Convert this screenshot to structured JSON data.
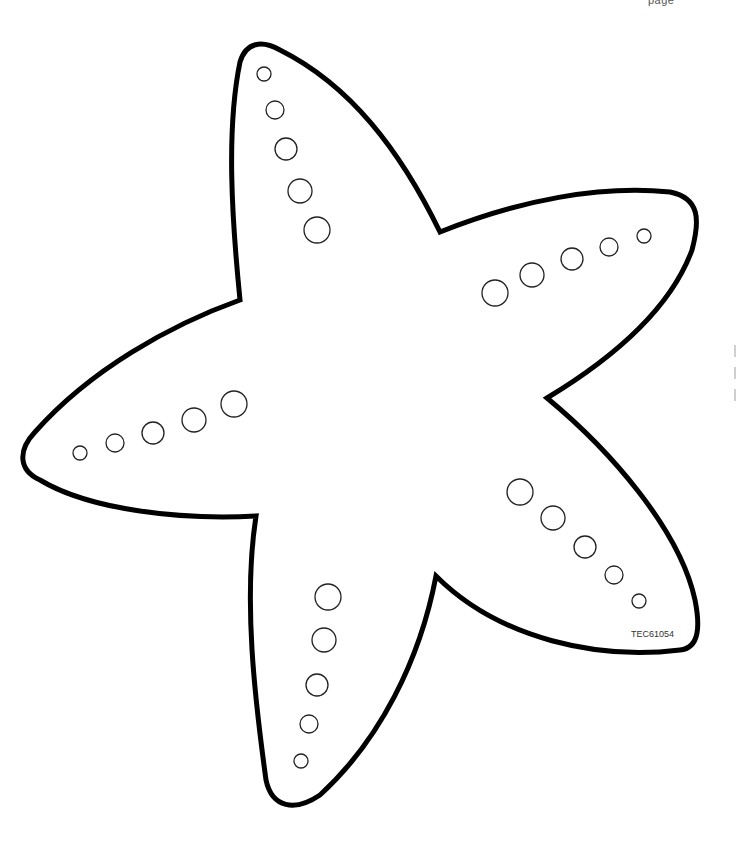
{
  "page": {
    "header_fragment": "page",
    "item_code": "TEC61054"
  },
  "illustration": {
    "subject": "starfish-outline",
    "outline_color": "#000000",
    "fill_color": "#ffffff",
    "spot_color": "#222222",
    "arms": [
      {
        "name": "top",
        "spots": 5
      },
      {
        "name": "right",
        "spots": 5
      },
      {
        "name": "lower-right",
        "spots": 5
      },
      {
        "name": "bottom",
        "spots": 5
      },
      {
        "name": "left",
        "spots": 5
      }
    ]
  }
}
